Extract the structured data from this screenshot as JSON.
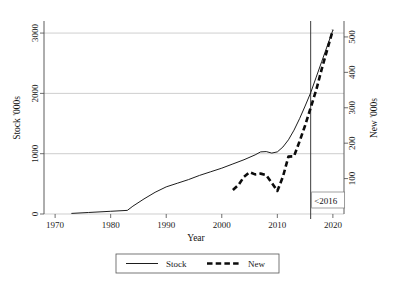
{
  "chart_data": {
    "type": "line",
    "title": "",
    "subtitle": "",
    "xlabel": "Year",
    "ylabel": "Stock '000s",
    "y2label": "New '000s",
    "xlim": [
      1968,
      2022
    ],
    "ylim": [
      0,
      3200
    ],
    "y2lim": [
      0,
      545
    ],
    "xticks": [
      1970,
      1980,
      1990,
      2000,
      2010,
      2020
    ],
    "xtick_labels": [
      "1970",
      "1980",
      "1990",
      "2000",
      "2010",
      "2020"
    ],
    "yticks": [
      0,
      1000,
      2000,
      3000
    ],
    "ytick_labels": [
      "0",
      "1000",
      "2000",
      "3000"
    ],
    "y2ticks": [
      100,
      200,
      300,
      400,
      500
    ],
    "y2tick_labels": [
      "100",
      "200",
      "300",
      "400",
      "500"
    ],
    "grid": true,
    "grid_axis": "y",
    "legend_position": "bottom-outside",
    "annotations": [
      {
        "name": "vertical-marker-2016",
        "text": "<2016",
        "x": 2016,
        "kind": "vline-with-label"
      }
    ],
    "series": [
      {
        "name": "Stock",
        "axis": "left",
        "style": "solid",
        "x": [
          1973,
          1976,
          1980,
          1983,
          1984,
          1986,
          1988,
          1990,
          1992,
          1994,
          1996,
          1998,
          2000,
          2002,
          2004,
          2006,
          2007,
          2008,
          2009,
          2010,
          2011,
          2012,
          2013,
          2014,
          2015,
          2016,
          2017,
          2018,
          2019,
          2020
        ],
        "values": [
          10,
          25,
          45,
          60,
          130,
          250,
          360,
          450,
          510,
          570,
          640,
          700,
          760,
          830,
          900,
          980,
          1030,
          1035,
          1010,
          1030,
          1110,
          1230,
          1390,
          1580,
          1790,
          2010,
          2270,
          2530,
          2790,
          3050
        ]
      },
      {
        "name": "New",
        "axis": "right",
        "style": "dashed",
        "x": [
          2002,
          2003,
          2004,
          2005,
          2006,
          2007,
          2008,
          2009,
          2010,
          2011,
          2012,
          2013,
          2014,
          2015,
          2016,
          2017,
          2018,
          2019,
          2020
        ],
        "values": [
          68,
          82,
          105,
          118,
          112,
          114,
          110,
          88,
          65,
          105,
          162,
          163,
          205,
          250,
          300,
          350,
          410,
          465,
          520
        ]
      }
    ]
  },
  "legend": {
    "entries": [
      {
        "label": "Stock",
        "style": "solid"
      },
      {
        "label": "New",
        "style": "dashed"
      }
    ]
  }
}
